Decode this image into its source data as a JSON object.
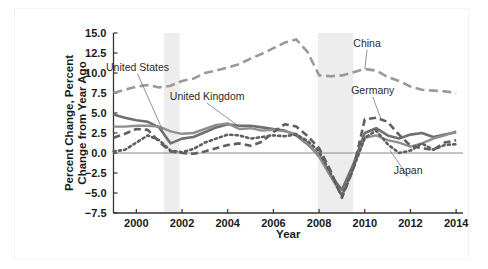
{
  "chart_data": {
    "type": "line",
    "title": "",
    "xlabel": "Year",
    "ylabel": "Percent Change, Percent Change from Year Ago",
    "ylabel_line1": "Percent Change, Percent",
    "ylabel_line2": "Change from Year Ago",
    "xlim": [
      1999,
      2014.3
    ],
    "ylim": [
      -7.5,
      15.0
    ],
    "ytick_labels": [
      "15.0",
      "12.5",
      "10.0",
      "7.5",
      "5.0",
      "2.5",
      "0.0",
      "-2.5",
      "-5.0",
      "-7.5"
    ],
    "ytick_values": [
      15.0,
      12.5,
      10.0,
      7.5,
      5.0,
      2.5,
      0.0,
      -2.5,
      -5.0,
      -7.5
    ],
    "xtick_labels": [
      "2000",
      "2002",
      "2004",
      "2006",
      "2008",
      "2010",
      "2012",
      "2014"
    ],
    "xtick_values": [
      2000,
      2002,
      2004,
      2006,
      2008,
      2010,
      2012,
      2014
    ],
    "grid": false,
    "legend_position": "inline-annotations",
    "zero_line": true,
    "recession_bands": [
      {
        "start": 2001.2,
        "end": 2001.9
      },
      {
        "start": 2007.95,
        "end": 2009.5
      }
    ],
    "annotations": [
      {
        "text": "United States",
        "x": 2000.05,
        "y": 10.3,
        "target_x": 2001.25,
        "target_y": 2.2
      },
      {
        "text": "United Kingdom",
        "x": 2003.1,
        "y": 6.6,
        "target_x": 2004.5,
        "target_y": 3.3
      },
      {
        "text": "China",
        "x": 2010.1,
        "y": 13.3,
        "target_x": 2010.0,
        "target_y": 10.5
      },
      {
        "text": "Germany",
        "x": 2010.35,
        "y": 7.4,
        "target_x": 2010.7,
        "target_y": 4.3
      },
      {
        "text": "Japan",
        "x": 2011.9,
        "y": -2.6,
        "target_x": 2011.1,
        "target_y": 0.35
      }
    ],
    "x": [
      1999.0,
      1999.5,
      2000.0,
      2000.5,
      2001.0,
      2001.5,
      2002.0,
      2002.5,
      2003.0,
      2003.5,
      2004.0,
      2004.5,
      2005.0,
      2005.5,
      2006.0,
      2006.5,
      2007.0,
      2007.5,
      2008.0,
      2008.5,
      2009.0,
      2009.5,
      2010.0,
      2010.5,
      2011.0,
      2011.5,
      2012.0,
      2012.5,
      2013.0,
      2013.5,
      2014.0
    ],
    "series": [
      {
        "name": "China",
        "style": "long-dash",
        "color": "#9a9a9a",
        "width": 2.6,
        "values": [
          7.5,
          7.9,
          8.3,
          8.5,
          8.2,
          8.4,
          9.0,
          9.3,
          10.0,
          10.3,
          10.7,
          11.1,
          11.8,
          12.4,
          13.1,
          13.8,
          14.2,
          12.6,
          9.7,
          9.6,
          9.7,
          10.1,
          10.5,
          10.3,
          9.5,
          9.0,
          8.3,
          7.9,
          7.8,
          7.7,
          7.5
        ]
      },
      {
        "name": "United States",
        "style": "solid-dark",
        "color": "#6f6f6f",
        "width": 2.6,
        "values": [
          4.8,
          4.4,
          4.1,
          3.9,
          3.2,
          1.2,
          1.8,
          2.0,
          2.6,
          3.2,
          3.6,
          3.4,
          3.4,
          3.2,
          3.0,
          2.8,
          2.2,
          1.1,
          -0.3,
          -2.8,
          -4.6,
          -1.4,
          2.5,
          3.1,
          2.2,
          1.8,
          2.3,
          2.5,
          2.0,
          2.3,
          2.6
        ]
      },
      {
        "name": "United Kingdom",
        "style": "solid-gray",
        "color": "#8f8f8f",
        "width": 2.4,
        "values": [
          3.3,
          3.3,
          3.4,
          3.4,
          3.3,
          2.7,
          2.4,
          2.5,
          3.0,
          3.5,
          3.7,
          3.0,
          3.1,
          2.8,
          2.9,
          2.7,
          2.4,
          1.2,
          -0.5,
          -2.9,
          -5.3,
          -1.8,
          1.9,
          2.2,
          1.6,
          1.3,
          0.8,
          1.2,
          1.8,
          2.2,
          2.7
        ]
      },
      {
        "name": "Germany",
        "style": "dash",
        "color": "#5f5f5f",
        "width": 2.6,
        "values": [
          1.9,
          2.4,
          3.0,
          2.9,
          1.4,
          0.2,
          0.0,
          -0.1,
          0.2,
          0.6,
          1.0,
          1.2,
          0.9,
          1.4,
          2.6,
          3.6,
          3.3,
          2.1,
          0.6,
          -2.2,
          -5.6,
          -2.0,
          4.2,
          4.4,
          3.9,
          2.3,
          0.9,
          0.6,
          0.4,
          1.3,
          1.6
        ]
      },
      {
        "name": "Japan",
        "style": "dot",
        "color": "#5f5f5f",
        "width": 2.6,
        "values": [
          0.2,
          0.4,
          1.3,
          2.2,
          1.6,
          0.3,
          0.1,
          0.5,
          1.3,
          1.8,
          2.3,
          2.2,
          1.8,
          2.0,
          2.2,
          2.1,
          2.3,
          1.5,
          0.2,
          -2.5,
          -5.4,
          -1.9,
          1.9,
          2.8,
          1.1,
          0.0,
          0.3,
          1.2,
          0.4,
          1.0,
          1.1
        ]
      }
    ]
  }
}
